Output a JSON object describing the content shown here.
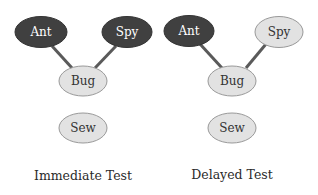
{
  "colors": {
    "active": "#404040",
    "inactive": "#e2e2e2",
    "edge": "#5a5a5a",
    "active_text": "#ffffff",
    "inactive_text": "#333333"
  },
  "panels": [
    {
      "caption": "Immediate Test",
      "nodes": [
        {
          "id": "ant",
          "label": "Ant",
          "state": "active"
        },
        {
          "id": "spy",
          "label": "Spy",
          "state": "active"
        },
        {
          "id": "bug",
          "label": "Bug",
          "state": "inactive"
        },
        {
          "id": "sew",
          "label": "Sew",
          "state": "inactive"
        }
      ],
      "edges": [
        [
          "ant",
          "bug"
        ],
        [
          "spy",
          "bug"
        ]
      ]
    },
    {
      "caption": "Delayed Test",
      "nodes": [
        {
          "id": "ant",
          "label": "Ant",
          "state": "active"
        },
        {
          "id": "spy",
          "label": "Spy",
          "state": "inactive"
        },
        {
          "id": "bug",
          "label": "Bug",
          "state": "inactive"
        },
        {
          "id": "sew",
          "label": "Sew",
          "state": "inactive"
        }
      ],
      "edges": [
        [
          "ant",
          "bug"
        ],
        [
          "spy",
          "bug"
        ]
      ]
    }
  ]
}
